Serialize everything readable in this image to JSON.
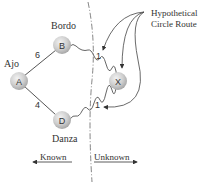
{
  "nodes": [
    {
      "id": "A",
      "label": "A",
      "name": "Ajo",
      "x": 19,
      "y": 81
    },
    {
      "id": "B",
      "label": "B",
      "name": "Bordo",
      "x": 62,
      "y": 45
    },
    {
      "id": "D",
      "label": "D",
      "name": "Danza",
      "x": 62,
      "y": 120
    },
    {
      "id": "X",
      "label": "X",
      "name": "",
      "x": 118,
      "y": 81
    }
  ],
  "edges": [
    {
      "from": "A",
      "to": "B",
      "weight": "6",
      "style": "solid"
    },
    {
      "from": "A",
      "to": "D",
      "weight": "4",
      "style": "solid"
    },
    {
      "from": "B",
      "to": "X",
      "weight": "1",
      "style": "wavy"
    },
    {
      "from": "D",
      "to": "X",
      "weight": "1",
      "style": "wavy"
    }
  ],
  "annotation": {
    "line1": "Hypothetical",
    "line2": "Circle Route"
  },
  "regions": {
    "known": "Known",
    "unknown": "Unknown"
  },
  "colors": {
    "node_fill": "#cfcfcf",
    "line": "#555555",
    "text": "#333333"
  }
}
